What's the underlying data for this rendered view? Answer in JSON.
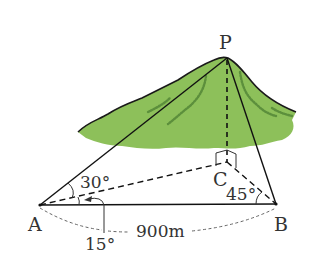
{
  "figure": {
    "type": "surveying diagram",
    "colors": {
      "mountain_fill": "#8dc05a",
      "mountain_shade": "#5c8f3c",
      "line": "#111111",
      "dotted_arc": "#666666"
    }
  },
  "points": {
    "P": {
      "label": "P"
    },
    "A": {
      "label": "A"
    },
    "B": {
      "label": "B"
    },
    "C": {
      "label": "C"
    }
  },
  "angles": {
    "PAC": "30°",
    "CAB": "15°",
    "CBA": "45°"
  },
  "distance": {
    "AB": "900m"
  }
}
